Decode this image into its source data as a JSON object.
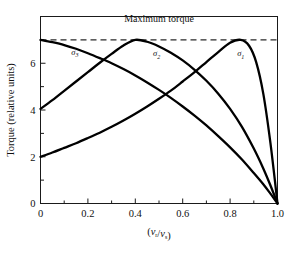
{
  "chart_data": {
    "type": "line",
    "title": "",
    "xlabel": "(v_r/v_s)",
    "ylabel": "Torque (relative units)",
    "xlim": [
      0.0,
      1.0
    ],
    "ylim": [
      0.0,
      8.0
    ],
    "grid": false,
    "legend_position": "inline-curve-labels",
    "xticks": [
      0.0,
      0.2,
      0.4,
      0.6,
      0.8,
      1.0
    ],
    "xticklabels": [
      "0",
      "0.2",
      "0.4",
      "0.6",
      "0.8",
      "1.0"
    ],
    "xminorticks": [
      0.1,
      0.3,
      0.5,
      0.7,
      0.9
    ],
    "yticks": [
      0,
      2,
      4,
      6
    ],
    "yticklabels": [
      "0",
      "2",
      "4",
      "6"
    ],
    "yminorticks": [
      1,
      3,
      5,
      7
    ],
    "annotations": [
      {
        "name": "maximum-torque-label",
        "text": "Maximum torque",
        "x": 0.5,
        "y": 7.75
      }
    ],
    "reference_lines": [
      {
        "name": "maximum-torque-line",
        "orientation": "horizontal",
        "y": 7.0,
        "style": "dashed"
      }
    ],
    "series": [
      {
        "name": "sigma_1",
        "label": "σ",
        "label_sub": "1",
        "label_x": 0.845,
        "label_y": 6.3,
        "peak_x": 0.845,
        "peak_y": 7.0,
        "start_value": 2.0,
        "end_value": 0.0,
        "x": [
          0.0,
          0.05,
          0.1,
          0.15,
          0.2,
          0.25,
          0.3,
          0.35,
          0.4,
          0.45,
          0.5,
          0.55,
          0.6,
          0.65,
          0.7,
          0.75,
          0.8,
          0.845,
          0.88,
          0.91,
          0.94,
          0.97,
          1.0
        ],
        "values": [
          2.0,
          2.18,
          2.38,
          2.58,
          2.8,
          3.03,
          3.28,
          3.55,
          3.84,
          4.15,
          4.48,
          4.83,
          5.22,
          5.62,
          6.05,
          6.48,
          6.88,
          7.0,
          6.75,
          6.05,
          4.7,
          2.6,
          0.0
        ]
      },
      {
        "name": "sigma_2",
        "label": "σ",
        "label_sub": "2",
        "label_x": 0.49,
        "label_y": 6.3,
        "peak_x": 0.4,
        "peak_y": 7.0,
        "start_value": 4.0,
        "end_value": 0.0,
        "x": [
          0.0,
          0.05,
          0.1,
          0.15,
          0.2,
          0.25,
          0.3,
          0.35,
          0.4,
          0.45,
          0.5,
          0.55,
          0.6,
          0.65,
          0.7,
          0.75,
          0.8,
          0.85,
          0.9,
          0.94,
          0.97,
          1.0
        ],
        "values": [
          4.05,
          4.42,
          4.82,
          5.22,
          5.62,
          6.02,
          6.4,
          6.76,
          7.0,
          6.92,
          6.72,
          6.45,
          6.12,
          5.72,
          5.25,
          4.7,
          4.05,
          3.28,
          2.35,
          1.5,
          0.78,
          0.0
        ]
      },
      {
        "name": "sigma_3",
        "label": "σ",
        "label_sub": "3",
        "label_x": 0.145,
        "label_y": 6.35,
        "peak_x": 0.0,
        "peak_y": 7.0,
        "start_value": 7.0,
        "end_value": 0.0,
        "x": [
          0.0,
          0.05,
          0.1,
          0.15,
          0.2,
          0.25,
          0.3,
          0.35,
          0.4,
          0.45,
          0.5,
          0.55,
          0.6,
          0.65,
          0.7,
          0.75,
          0.8,
          0.85,
          0.9,
          0.94,
          0.97,
          1.0
        ],
        "values": [
          7.0,
          6.9,
          6.78,
          6.62,
          6.43,
          6.22,
          6.0,
          5.75,
          5.48,
          5.18,
          4.86,
          4.52,
          4.15,
          3.76,
          3.34,
          2.88,
          2.4,
          1.88,
          1.3,
          0.82,
          0.42,
          0.0
        ]
      }
    ]
  }
}
